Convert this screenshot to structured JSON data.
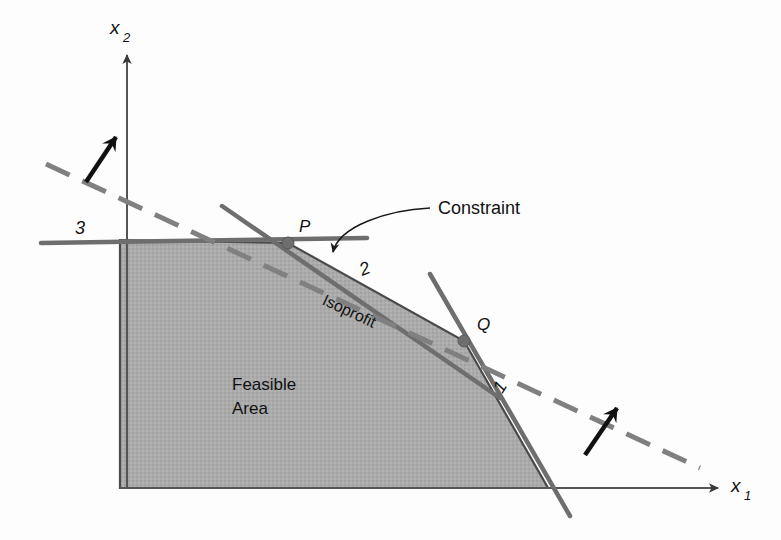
{
  "figure": {
    "type": "linear-programming-graph",
    "title": "",
    "background_color": "#fdfdfd"
  },
  "colors": {
    "feasible_fill": "#a9a9a9",
    "feasible_edge": "#4d4d4d",
    "constraint_line": "#6e6e6e",
    "isoprofit_line": "#7a7a7a",
    "axis": "#555555",
    "arrow_black": "#111111",
    "text": "#111111"
  },
  "axes": {
    "x_axis": {
      "label": "x",
      "subscript": "1",
      "name": "x1-axis",
      "from": [
        120,
        488
      ],
      "to": [
        718,
        488
      ]
    },
    "y_axis": {
      "label": "x",
      "subscript": "2",
      "name": "x2-axis",
      "from": [
        127,
        488
      ],
      "to": [
        127,
        55
      ]
    }
  },
  "constraints": [
    {
      "id": "constraint-1",
      "label": "1",
      "label_pos": [
        505,
        390
      ],
      "label_rotation": -58,
      "from": [
        430,
        274
      ],
      "to": [
        570,
        516
      ]
    },
    {
      "id": "constraint-2",
      "label": "2",
      "label_pos": [
        367,
        274
      ],
      "label_rotation": -22,
      "from": [
        222,
        206
      ],
      "to": [
        500,
        398
      ]
    },
    {
      "id": "constraint-3",
      "label": "3",
      "label_pos": [
        80,
        234
      ],
      "label_rotation": 0,
      "from": [
        41,
        243
      ],
      "to": [
        367,
        238
      ]
    }
  ],
  "isoprofit": {
    "id": "isoprofit-line",
    "label": "Isoprofit",
    "label_pos": [
      347,
      316
    ],
    "label_rotation": 25,
    "from": [
      46,
      164
    ],
    "to": [
      700,
      468
    ],
    "style": "dashed"
  },
  "improvement_arrows": [
    {
      "id": "improvement-arrow-upper-left",
      "from": [
        86,
        182
      ],
      "to": [
        116,
        137
      ]
    },
    {
      "id": "improvement-arrow-lower-right",
      "from": [
        585,
        455
      ],
      "to": [
        617,
        408
      ]
    }
  ],
  "vertices": [
    {
      "id": "vertex-P",
      "label": "P",
      "label_pos": [
        299,
        232
      ],
      "point": [
        288,
        243
      ]
    },
    {
      "id": "vertex-Q",
      "label": "Q",
      "label_pos": [
        477,
        330
      ],
      "point": [
        464,
        341
      ]
    }
  ],
  "feasible_region": {
    "id": "feasible-region",
    "label_line1": "Feasible",
    "label_line2": "Area",
    "label_pos": [
      232,
      390
    ],
    "polygon": "120,488 120,240 288,243 464,341 548,488"
  },
  "callout": {
    "id": "constraint-callout",
    "label": "Constraint",
    "label_pos": [
      438,
      214
    ],
    "leader_from": [
      430,
      208
    ],
    "leader_to": [
      333,
      252
    ]
  }
}
